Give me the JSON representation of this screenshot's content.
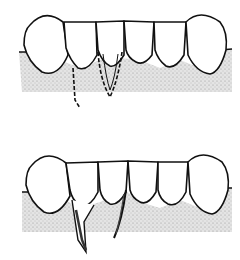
{
  "figure": {
    "panels": [
      {
        "name": "top-panel",
        "caption": ""
      },
      {
        "name": "bottom-panel",
        "caption": ""
      }
    ],
    "colors": {
      "line": "#111111",
      "gum": "#d8d8d8",
      "background": "#ffffff"
    }
  }
}
